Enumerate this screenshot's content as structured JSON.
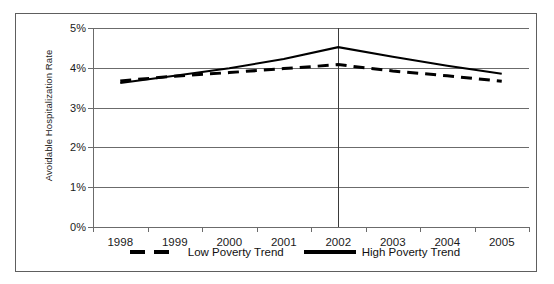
{
  "chart_data": {
    "type": "line",
    "title": "",
    "xlabel": "",
    "ylabel": "Avoidable Hospitalization Rate",
    "categories": [
      "1998",
      "1999",
      "2000",
      "2001",
      "2002",
      "2003",
      "2004",
      "2005"
    ],
    "ylim": [
      0,
      5
    ],
    "ytick_labels": [
      "5%",
      "4%",
      "3%",
      "2%",
      "1%",
      "0%"
    ],
    "ytick_values": [
      5,
      4,
      3,
      2,
      1,
      0
    ],
    "grid": true,
    "legend_position": "bottom",
    "annotations": [
      {
        "name": "reference-line-2002",
        "x": "2002",
        "style": "vertical-solid"
      }
    ],
    "series": [
      {
        "name": "Low Poverty Trend",
        "style": "dashed",
        "color": "#000000",
        "values": [
          3.67,
          3.79,
          3.88,
          3.98,
          4.08,
          3.92,
          3.8,
          3.66
        ]
      },
      {
        "name": "High Poverty Trend",
        "style": "solid",
        "color": "#000000",
        "values": [
          3.62,
          3.8,
          3.99,
          4.22,
          4.52,
          4.28,
          4.05,
          3.85
        ]
      }
    ]
  },
  "legend": {
    "entries": [
      {
        "label": "Low Poverty Trend",
        "style": "dashed"
      },
      {
        "label": "High Poverty Trend",
        "style": "solid"
      }
    ]
  },
  "colors": {
    "series_line": "#000000",
    "gridline": "#6b6b6b",
    "frame": "#5e5e5e",
    "text": "#1a1a1a",
    "background": "#ffffff"
  }
}
